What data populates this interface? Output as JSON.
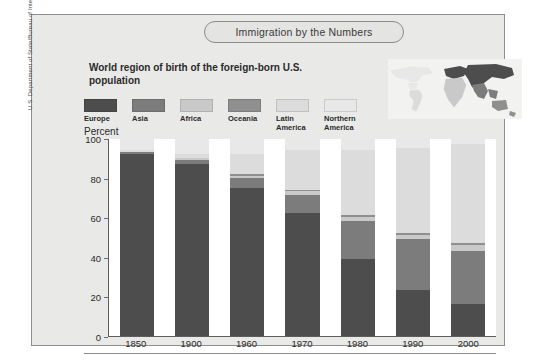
{
  "banner": {
    "title": "Immigration by the Numbers"
  },
  "legend_heading": "World region of birth of the\nforeign-born U.S. population",
  "axis": {
    "y_title": "Percent"
  },
  "source_credit": "U.S. Department of State/Bureau of International Immigration Programs",
  "icons": {
    "world_map": "world-map-icon"
  },
  "chart_data": {
    "type": "bar",
    "stacked": true,
    "title": "Immigration by the Numbers",
    "subtitle": "World region of birth of the foreign-born U.S. population",
    "xlabel": "",
    "ylabel": "Percent",
    "ylim": [
      0,
      100
    ],
    "yticks": [
      0,
      20,
      40,
      60,
      80,
      100
    ],
    "grid": false,
    "legend_position": "top-left",
    "categories": [
      "1850",
      "1900",
      "1960",
      "1970",
      "1980",
      "1990",
      "2000"
    ],
    "series": [
      {
        "name": "Europe",
        "color": "#4d4d4d",
        "values": [
          92,
          87,
          75,
          62,
          39,
          23,
          16
        ]
      },
      {
        "name": "Asia",
        "color": "#7c7c7c",
        "values": [
          1,
          2,
          5,
          9,
          19,
          26,
          27
        ]
      },
      {
        "name": "Africa",
        "color": "#c9c9c9",
        "values": [
          0,
          1,
          1,
          2,
          2,
          2,
          3
        ]
      },
      {
        "name": "Oceania",
        "color": "#8f8f8f",
        "values": [
          0,
          0,
          1,
          1,
          1,
          1,
          1
        ]
      },
      {
        "name": "Latin America",
        "color": "#dcdcdc",
        "values": [
          1,
          2,
          10,
          20,
          33,
          43,
          50
        ]
      },
      {
        "name": "Northern America",
        "color": "#e8e8e8",
        "values": [
          6,
          8,
          8,
          6,
          6,
          5,
          3
        ]
      }
    ]
  }
}
